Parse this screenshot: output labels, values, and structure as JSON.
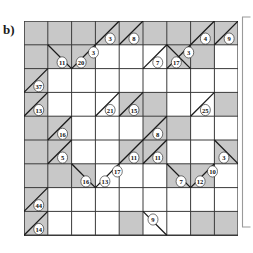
{
  "figure": {
    "panel_label": "b)",
    "grid": {
      "rows": 9,
      "cols": 9,
      "cell_size": 23.8,
      "origin_x": 24,
      "origin_y": 21,
      "line_color": "#3a3a3a",
      "shaded_color": "#c8c8c8",
      "empty_color": "#ffffff",
      "diagonal_color": "#1a1a1a"
    },
    "bracket": {
      "color": "#9a9a9a",
      "label": ""
    },
    "shaded_cells": [
      [
        1,
        1
      ],
      [
        1,
        2
      ],
      [
        1,
        3
      ],
      [
        1,
        4
      ],
      [
        1,
        5
      ],
      [
        1,
        6
      ],
      [
        1,
        7
      ],
      [
        1,
        8
      ],
      [
        1,
        9
      ],
      [
        2,
        1
      ],
      [
        2,
        2
      ],
      [
        2,
        3
      ],
      [
        2,
        7
      ],
      [
        2,
        8
      ],
      [
        3,
        1
      ],
      [
        4,
        1
      ],
      [
        4,
        5
      ],
      [
        4,
        6
      ],
      [
        4,
        9
      ],
      [
        5,
        1
      ],
      [
        5,
        2
      ],
      [
        5,
        6
      ],
      [
        5,
        7
      ],
      [
        6,
        1
      ],
      [
        6,
        2
      ],
      [
        6,
        5
      ],
      [
        6,
        6
      ],
      [
        6,
        9
      ],
      [
        7,
        1
      ],
      [
        7,
        2
      ],
      [
        7,
        3
      ],
      [
        7,
        7
      ],
      [
        7,
        8
      ],
      [
        8,
        1
      ],
      [
        9,
        1
      ],
      [
        9,
        5
      ],
      [
        9,
        8
      ],
      [
        9,
        9
      ]
    ],
    "diagonals": [
      {
        "row": 1,
        "col": 4,
        "dir": "tr-bl"
      },
      {
        "row": 1,
        "col": 5,
        "dir": "tr-bl"
      },
      {
        "row": 1,
        "col": 8,
        "dir": "tr-bl"
      },
      {
        "row": 1,
        "col": 9,
        "dir": "tr-bl"
      },
      {
        "row": 2,
        "col": 2,
        "dir": "br-tl"
      },
      {
        "row": 2,
        "col": 3,
        "dir": "tr-bl"
      },
      {
        "row": 2,
        "col": 6,
        "dir": "tr-bl"
      },
      {
        "row": 2,
        "col": 7,
        "dir": "br-tl"
      },
      {
        "row": 2,
        "col": 7,
        "dir": "tr-bl"
      },
      {
        "row": 3,
        "col": 1,
        "dir": "tr-bl"
      },
      {
        "row": 4,
        "col": 1,
        "dir": "tr-bl"
      },
      {
        "row": 4,
        "col": 4,
        "dir": "tr-bl"
      },
      {
        "row": 4,
        "col": 5,
        "dir": "tr-bl"
      },
      {
        "row": 4,
        "col": 8,
        "dir": "tr-bl"
      },
      {
        "row": 5,
        "col": 2,
        "dir": "tr-bl"
      },
      {
        "row": 5,
        "col": 6,
        "dir": "tr-bl"
      },
      {
        "row": 6,
        "col": 2,
        "dir": "tr-bl"
      },
      {
        "row": 6,
        "col": 5,
        "dir": "tr-bl"
      },
      {
        "row": 6,
        "col": 6,
        "dir": "tr-bl"
      },
      {
        "row": 6,
        "col": 9,
        "dir": "br-tl"
      },
      {
        "row": 7,
        "col": 3,
        "dir": "br-tl"
      },
      {
        "row": 7,
        "col": 4,
        "dir": "tr-bl"
      },
      {
        "row": 7,
        "col": 7,
        "dir": "br-tl"
      },
      {
        "row": 7,
        "col": 8,
        "dir": "tr-bl"
      },
      {
        "row": 8,
        "col": 1,
        "dir": "tr-bl"
      },
      {
        "row": 9,
        "col": 1,
        "dir": "tr-bl"
      },
      {
        "row": 9,
        "col": 6,
        "dir": "br-tl"
      }
    ],
    "clues": [
      {
        "value": "3",
        "row": 1,
        "col": 4,
        "cx": 0.62,
        "cy": 0.74
      },
      {
        "value": "8",
        "row": 1,
        "col": 5,
        "cx": 0.62,
        "cy": 0.74
      },
      {
        "value": "4",
        "row": 1,
        "col": 8,
        "cx": 0.62,
        "cy": 0.74
      },
      {
        "value": "9",
        "row": 1,
        "col": 9,
        "cx": 0.62,
        "cy": 0.74
      },
      {
        "value": "11",
        "row": 2,
        "col": 2,
        "cx": 0.6,
        "cy": 0.74
      },
      {
        "value": "20",
        "row": 2,
        "col": 3,
        "cx": 0.4,
        "cy": 0.74
      },
      {
        "value": "3",
        "row": 2,
        "col": 3,
        "cx": 0.92,
        "cy": 0.32
      },
      {
        "value": "7",
        "row": 2,
        "col": 6,
        "cx": 0.62,
        "cy": 0.74
      },
      {
        "value": "17",
        "row": 2,
        "col": 7,
        "cx": 0.4,
        "cy": 0.74
      },
      {
        "value": "3",
        "row": 2,
        "col": 7,
        "cx": 0.92,
        "cy": 0.32
      },
      {
        "value": "37",
        "row": 3,
        "col": 1,
        "cx": 0.62,
        "cy": 0.74
      },
      {
        "value": "13",
        "row": 4,
        "col": 1,
        "cx": 0.62,
        "cy": 0.74
      },
      {
        "value": "21",
        "row": 4,
        "col": 4,
        "cx": 0.62,
        "cy": 0.74
      },
      {
        "value": "15",
        "row": 4,
        "col": 5,
        "cx": 0.62,
        "cy": 0.74
      },
      {
        "value": "25",
        "row": 4,
        "col": 8,
        "cx": 0.62,
        "cy": 0.74
      },
      {
        "value": "16",
        "row": 5,
        "col": 2,
        "cx": 0.62,
        "cy": 0.74
      },
      {
        "value": "8",
        "row": 5,
        "col": 6,
        "cx": 0.62,
        "cy": 0.74
      },
      {
        "value": "5",
        "row": 6,
        "col": 2,
        "cx": 0.62,
        "cy": 0.74
      },
      {
        "value": "11",
        "row": 6,
        "col": 5,
        "cx": 0.62,
        "cy": 0.74
      },
      {
        "value": "11",
        "row": 6,
        "col": 6,
        "cx": 0.62,
        "cy": 0.74
      },
      {
        "value": "3",
        "row": 6,
        "col": 9,
        "cx": 0.4,
        "cy": 0.74
      },
      {
        "value": "16",
        "row": 7,
        "col": 3,
        "cx": 0.6,
        "cy": 0.74
      },
      {
        "value": "13",
        "row": 7,
        "col": 4,
        "cx": 0.4,
        "cy": 0.74
      },
      {
        "value": "17",
        "row": 7,
        "col": 4,
        "cx": 0.92,
        "cy": 0.32
      },
      {
        "value": "7",
        "row": 7,
        "col": 7,
        "cx": 0.6,
        "cy": 0.74
      },
      {
        "value": "12",
        "row": 7,
        "col": 8,
        "cx": 0.4,
        "cy": 0.74
      },
      {
        "value": "10",
        "row": 7,
        "col": 8,
        "cx": 0.92,
        "cy": 0.32
      },
      {
        "value": "44",
        "row": 8,
        "col": 1,
        "cx": 0.62,
        "cy": 0.74
      },
      {
        "value": "14",
        "row": 9,
        "col": 1,
        "cx": 0.62,
        "cy": 0.74
      },
      {
        "value": "9",
        "row": 9,
        "col": 6,
        "cx": 0.42,
        "cy": 0.34
      }
    ]
  }
}
